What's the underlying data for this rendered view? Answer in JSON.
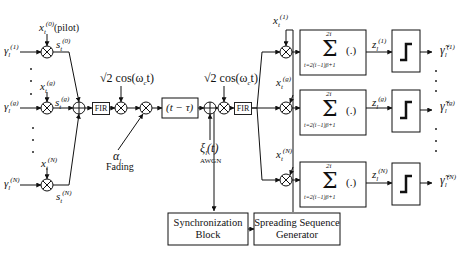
{
  "diagram": {
    "type": "block-diagram",
    "title": "",
    "inputs": [
      {
        "symbol_base": "γ",
        "sub": "l",
        "sup": "(1)",
        "spread_code_base": "x",
        "spread_code_sup": "(0)",
        "spread_code_note": "(pilot)",
        "product_base": "s",
        "product_sup": "(0)"
      },
      {
        "symbol_base": "γ",
        "sub": "l",
        "sup": "(g)",
        "spread_code_base": "x",
        "spread_code_sup": "(g)",
        "product_base": "s",
        "product_sup": "(g)"
      },
      {
        "symbol_base": "γ",
        "sub": "l",
        "sup": "(N)",
        "spread_code_base": "x",
        "spread_code_sup": "(N)",
        "product_base": "s",
        "product_sup": "(N)"
      }
    ],
    "tx_chain": {
      "fir1_label": "FIR",
      "carrier1_label": "√2 cos(ω",
      "carrier1_sub": "c",
      "carrier1_tail": "t)",
      "fading_symbol": "α",
      "fading_sub": "l",
      "fading_label": "Fading",
      "delay_label": "(t − τ)",
      "noise_symbol": "ξ",
      "noise_sub": "l",
      "noise_tail": "(t)",
      "noise_label": "AWGN",
      "carrier2_label": "√2 cos(ω",
      "carrier2_sub": "c",
      "carrier2_tail": "t)",
      "fir2_label": "FIR"
    },
    "rx_branches": [
      {
        "code_base": "x",
        "code_sup": "(1)",
        "sum_upper": "2i",
        "sum_lower": "t=2(i−1)β+1",
        "sum_arg": "(.)",
        "decision_base": "z",
        "decision_sup": "(1)",
        "output_base": "γ̃",
        "output_sup": "(1)"
      },
      {
        "code_base": "x",
        "code_sup": "(g)",
        "sum_upper": "2i",
        "sum_lower": "t=2(i−1)β+1",
        "sum_arg": "(.)",
        "decision_base": "z",
        "decision_sup": "(g)",
        "output_base": "γ̃",
        "output_sup": "(g)"
      },
      {
        "code_base": "x",
        "code_sup": "(N)",
        "sum_upper": "2i",
        "sum_lower": "t=2(i−1)β+1",
        "sum_arg": "(.)",
        "decision_base": "z",
        "decision_sup": "(N)",
        "output_base": "γ̃",
        "output_sup": "(N)"
      }
    ],
    "code_sub": "t",
    "output_sub": "l",
    "blocks": {
      "sync_line1": "Synchronization",
      "sync_line2": "Block",
      "gen_line1": "Spreading Sequence",
      "gen_line2": "Generator"
    },
    "symbols": {
      "sum": "Σ",
      "multiplier": "multiplier-circle-icon",
      "adder": "adder-circle-icon",
      "threshold": "step-threshold-icon"
    }
  }
}
